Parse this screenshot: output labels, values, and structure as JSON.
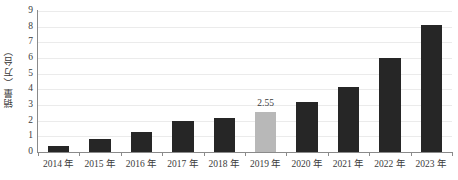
{
  "chart_data": {
    "type": "bar",
    "title": "",
    "subtitle": "",
    "xlabel": "",
    "ylabel": "销量（万台）",
    "categories": [
      "2014 年",
      "2015 年",
      "2016 年",
      "2017 年",
      "2018 年",
      "2019 年",
      "2020 年",
      "2021 年",
      "2022 年",
      "2023 年"
    ],
    "values": [
      0.4,
      0.8,
      1.25,
      1.95,
      2.2,
      2.55,
      3.2,
      4.15,
      6.0,
      8.1
    ],
    "ylim": [
      0,
      9
    ],
    "y_ticks": [
      0,
      1,
      2,
      3,
      4,
      5,
      6,
      7,
      8,
      9
    ],
    "y_tick_labels": [
      "0",
      "1",
      "2",
      "3",
      "4",
      "5",
      "6",
      "7",
      "8",
      "9"
    ],
    "grid": true,
    "legend": "none",
    "data_labels": [
      null,
      null,
      null,
      null,
      null,
      "2.55",
      null,
      null,
      null,
      null
    ],
    "highlight_index": 5,
    "colors": {
      "bar": "#262626",
      "bar_highlight": "#b8b8b8",
      "axis": "#8a8a8a",
      "grid": "#ebebeb",
      "text": "#3b3b3b",
      "background": "#ffffff"
    }
  }
}
